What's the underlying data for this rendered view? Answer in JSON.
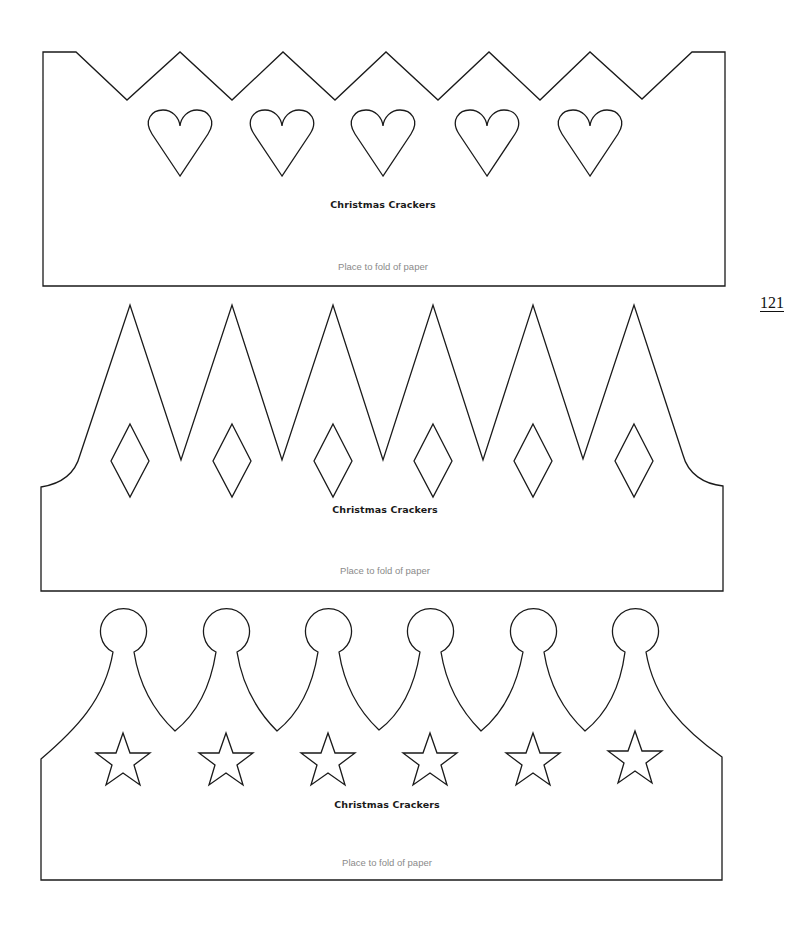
{
  "page": {
    "number": "121",
    "background": "#ffffff",
    "line_color": "#1a1a1a"
  },
  "templates": [
    {
      "id": "zigzag-crown",
      "title": "Christmas Crackers",
      "fold_note": "Place to fold of paper",
      "cutouts": {
        "shape": "heart",
        "count": 5
      }
    },
    {
      "id": "spike-crown",
      "title": "Christmas Crackers",
      "fold_note": "Place to fold of paper",
      "cutouts": {
        "shape": "diamond",
        "count": 6
      }
    },
    {
      "id": "ball-crown",
      "title": "Christmas Crackers",
      "fold_note": "Place to fold of paper",
      "cutouts": {
        "shape": "star",
        "count": 6
      }
    }
  ]
}
